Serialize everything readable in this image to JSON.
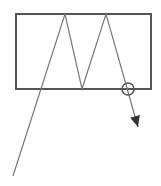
{
  "diagram": {
    "colors": {
      "background": "#ffffff",
      "box_stroke": "#555555",
      "ray_stroke": "#777777",
      "marker_stroke": "#555555",
      "arrow_fill": "#333333"
    },
    "box": {
      "x": 16,
      "y": 14,
      "width": 135,
      "height": 75
    },
    "ray_path": "M13,176 L65,14 L82,89 L106,14 L138,127",
    "exit_marker": {
      "cx": 128,
      "cy": 89,
      "r": 6
    },
    "arrowhead": {
      "tip_x": 138,
      "tip_y": 127
    }
  }
}
